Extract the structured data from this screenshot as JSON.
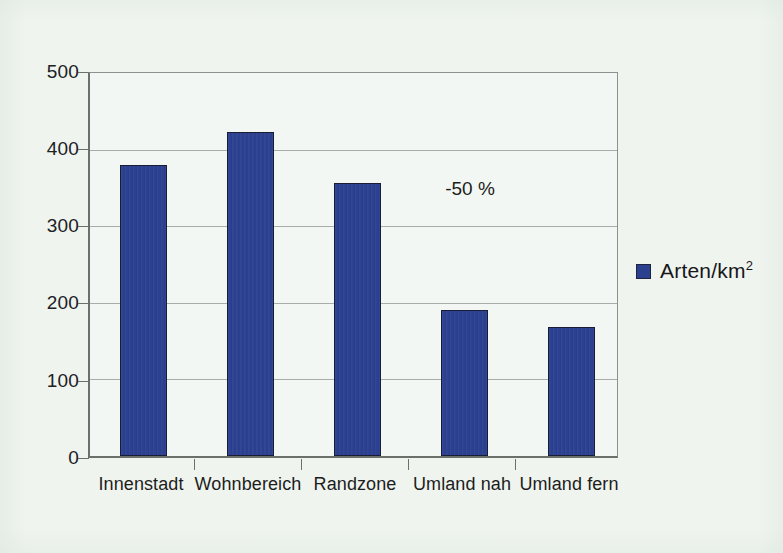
{
  "chart_data": {
    "type": "bar",
    "title": "",
    "subtitle": "",
    "xlabel": "",
    "ylabel": "",
    "categories": [
      "Innenstadt",
      "Wohnbereich",
      "Randzone",
      "Umland nah",
      "Umland fern"
    ],
    "series": [
      {
        "name": "Arten/km2",
        "name_display": "Arten/km",
        "name_exponent": "2",
        "color": "#2b4190",
        "values": [
          380,
          423,
          357,
          191,
          168
        ]
      }
    ],
    "ylim": [
      0,
      500
    ],
    "ytick_labels": [
      "0",
      "100",
      "200",
      "300",
      "400",
      "500"
    ],
    "ytick_values": [
      0,
      100,
      200,
      300,
      400,
      500
    ],
    "grid": "horizontal",
    "legend_position": "right",
    "annotations": [
      {
        "text": "-50 %",
        "x_category_between": "Randzone-Umland nah",
        "y_value": 355
      }
    ],
    "colors": {
      "bar_fill": "#2b4190",
      "bar_outline": "#191c34",
      "plot_background": "#f3f7f3",
      "figure_background": "#eff4ef",
      "gridline": "#a9aca9",
      "axis": "#6d6f6d",
      "text": "#1d1d1c"
    }
  }
}
